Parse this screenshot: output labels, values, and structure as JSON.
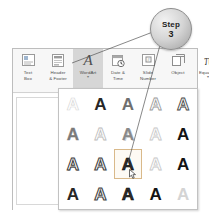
{
  "callout": {
    "name": "step-callout",
    "word": "Step",
    "number": "3"
  },
  "ribbon": {
    "name": "insert-ribbon-text-group",
    "items": [
      {
        "label_line1": "Text",
        "label_line2": "Box",
        "icon": "text-box-icon",
        "state": "normal",
        "caret": ""
      },
      {
        "label_line1": "Header",
        "label_line2": "& Footer",
        "icon": "header-footer-icon",
        "state": "normal",
        "caret": ""
      },
      {
        "label_line1": "WordArt",
        "label_line2": "",
        "icon": "wordart-icon",
        "state": "active",
        "caret": "▾"
      },
      {
        "label_line1": "Date &",
        "label_line2": "Time",
        "icon": "date-time-icon",
        "state": "normal",
        "caret": ""
      },
      {
        "label_line1": "Slide",
        "label_line2": "Number",
        "icon": "slide-number-icon",
        "state": "normal",
        "caret": ""
      },
      {
        "label_line1": "Object",
        "label_line2": "",
        "icon": "object-icon",
        "state": "normal",
        "caret": ""
      },
      {
        "label_line1": "Equation",
        "label_line2": "",
        "icon": "equation-pi-icon",
        "state": "normal",
        "caret": "▾"
      },
      {
        "label_line1": "Symbol",
        "label_line2": "",
        "icon": "symbol-omega-icon",
        "state": "disabled",
        "caret": ""
      },
      {
        "label_line1": "V",
        "label_line2": "",
        "icon": "video-icon",
        "state": "normal",
        "caret": ""
      }
    ]
  },
  "gallery": {
    "name": "wordart-style-gallery",
    "columns": 5,
    "rows": 4,
    "letter": "A",
    "selected_index": 12,
    "cells": [
      {
        "style": "v-outline-light"
      },
      {
        "style": "v-solid-dark"
      },
      {
        "style": "v-solid-grey"
      },
      {
        "style": "v-outline-mid"
      },
      {
        "style": "v-outline-dark"
      },
      {
        "style": "v-thin-grey"
      },
      {
        "style": "v-ring"
      },
      {
        "style": "v-shadow"
      },
      {
        "style": "v-ghost"
      },
      {
        "style": "v-solid-black"
      },
      {
        "style": "v-bevel"
      },
      {
        "style": "v-heavy2"
      },
      {
        "style": "v-fill-dark"
      },
      {
        "style": "v-ghost"
      },
      {
        "style": "v-solid-black"
      },
      {
        "style": "v-solid-dark"
      },
      {
        "style": "v-heavy2"
      },
      {
        "style": "v-fill-dark"
      },
      {
        "style": "v-solid-black"
      },
      {
        "style": "v-faint"
      }
    ]
  },
  "cursor": {
    "name": "mouse-pointer",
    "on_cell_index": 12
  },
  "colors": {
    "window_border": "#bdbdbd",
    "ribbon_bg": "#f7f7f7",
    "active_button_bg": "#d6d6d6",
    "gallery_border": "#c2c2c2",
    "selection_border": "#d9b98a",
    "disabled_text": "#b5b5b5"
  }
}
